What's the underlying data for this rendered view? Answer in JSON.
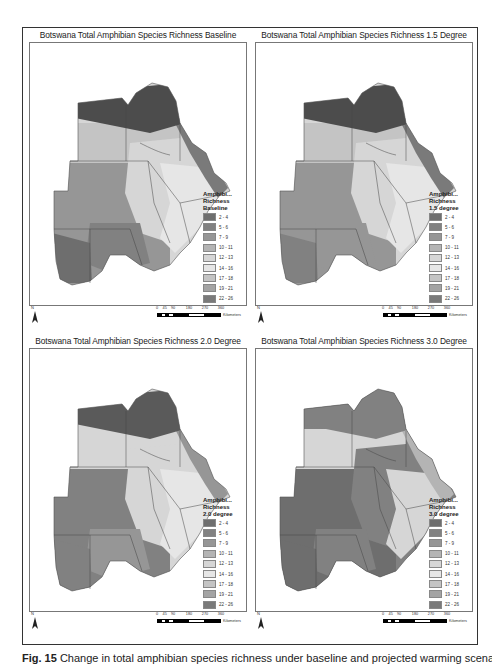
{
  "figure": {
    "caption_label": "Fig. 15",
    "caption_text": "Change in total amphibian species richness under baseline and projected warming scenarios"
  },
  "legend_classes": [
    {
      "label": "2 - 4",
      "color": "#6e6e6e"
    },
    {
      "label": "5 - 6",
      "color": "#818181"
    },
    {
      "label": "7 - 9",
      "color": "#969696"
    },
    {
      "label": "10 - 11",
      "color": "#b4b4b4"
    },
    {
      "label": "12 - 13",
      "color": "#d6d6d6"
    },
    {
      "label": "14 - 16",
      "color": "#e6e6e6"
    },
    {
      "label": "17 - 18",
      "color": "#c4c4c4"
    },
    {
      "label": "19 - 21",
      "color": "#a4a4a4"
    },
    {
      "label": "22 - 26",
      "color": "#7a7a7a"
    },
    {
      "label": "27 - 34",
      "color": "#4c4c4c"
    }
  ],
  "scale": {
    "ticks": [
      "0",
      "45",
      "90",
      "180",
      "270",
      "360"
    ],
    "unit": "Kilometers"
  },
  "north_label": "N",
  "panels": [
    {
      "title": "Botswana Total Amphibian Species Richness Baseline",
      "legend_title": [
        "Amphibi...",
        "Richness",
        "Baseline"
      ],
      "zones": {
        "north": "#4c4c4c",
        "northwest": "#c4c4c4",
        "west": "#969696",
        "center": "#d6d6d6",
        "east": "#e6e6e6",
        "eastedge": "#7a7a7a",
        "south": "#818181",
        "southwest": "#6e6e6e"
      }
    },
    {
      "title": "Botswana Total Amphibian Species Richness 1.5 Degree",
      "legend_title": [
        "Amphibi...",
        "Richness",
        "1.5 degree"
      ],
      "zones": {
        "north": "#4c4c4c",
        "northwest": "#c4c4c4",
        "west": "#969696",
        "center": "#d6d6d6",
        "east": "#e6e6e6",
        "eastedge": "#7a7a7a",
        "south": "#969696",
        "southwest": "#818181"
      }
    },
    {
      "title": "Botswana Total Amphibian Species Richness 2.0 Degree",
      "legend_title": [
        "Amphibi...",
        "Richness",
        "2.0 degree"
      ],
      "zones": {
        "north": "#5a5a5a",
        "northwest": "#d6d6d6",
        "west": "#818181",
        "center": "#d6d6d6",
        "east": "#e6e6e6",
        "eastedge": "#969696",
        "south": "#969696",
        "southwest": "#818181"
      }
    },
    {
      "title": "Botswana Total Amphibian Species Richness 3.0 Degree",
      "legend_title": [
        "Amphibi...",
        "Richness",
        "3.0 degree"
      ],
      "zones": {
        "north": "#818181",
        "northwest": "#d6d6d6",
        "west": "#6e6e6e",
        "center": "#818181",
        "east": "#d6d6d6",
        "eastedge": "#b4b4b4",
        "south": "#818181",
        "southwest": "#6e6e6e"
      }
    }
  ]
}
